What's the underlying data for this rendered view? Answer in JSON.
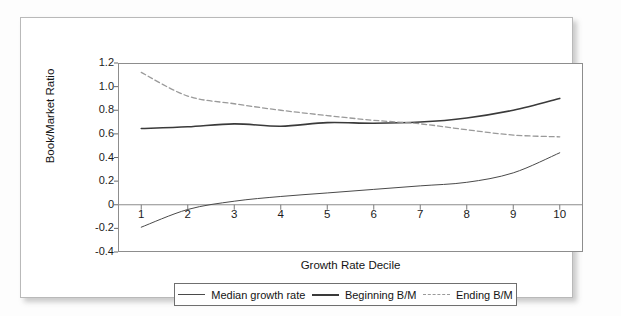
{
  "figure": {
    "y_axis_title": "Book/Market Ratio",
    "x_axis_title": "Growth Rate Decile"
  },
  "legend": {
    "items": [
      {
        "label": "Median growth rate",
        "style": "solid-thin",
        "color": "#4a4a4a"
      },
      {
        "label": "Beginning B/M",
        "style": "solid-thick",
        "color": "#3a3a3a"
      },
      {
        "label": "Ending B/M",
        "style": "dashed",
        "color": "#9a9a9a"
      }
    ]
  },
  "chart_data": {
    "type": "line",
    "title": "",
    "xlabel": "Growth Rate Decile",
    "ylabel": "Book/Market Ratio",
    "x": [
      1,
      2,
      3,
      4,
      5,
      6,
      7,
      8,
      9,
      10
    ],
    "categories": [
      "1",
      "2",
      "3",
      "4",
      "5",
      "6",
      "7",
      "8",
      "9",
      "10"
    ],
    "xlim": [
      0.5,
      10.5
    ],
    "ylim": [
      -0.4,
      1.2
    ],
    "yticks": [
      1.2,
      1.0,
      0.8,
      0.6,
      0.4,
      0.2,
      0,
      -0.2,
      -0.4
    ],
    "ytick_labels": [
      "1.2",
      "1.0",
      "0.8",
      "0.6",
      "0.4",
      "0.2",
      "0",
      "-0.2",
      "-0.4"
    ],
    "xticks": [
      1,
      2,
      3,
      4,
      5,
      6,
      7,
      8,
      9,
      10
    ],
    "grid": false,
    "legend_position": "bottom",
    "zero_line": 0,
    "series": [
      {
        "name": "Median growth rate",
        "style": "solid-thin",
        "color": "#4a4a4a",
        "values": [
          -0.19,
          -0.04,
          0.03,
          0.07,
          0.1,
          0.13,
          0.16,
          0.19,
          0.27,
          0.44
        ]
      },
      {
        "name": "Beginning B/M",
        "style": "solid-thick",
        "color": "#3a3a3a",
        "values": [
          0.645,
          0.66,
          0.685,
          0.665,
          0.695,
          0.69,
          0.7,
          0.735,
          0.8,
          0.9
        ]
      },
      {
        "name": "Ending B/M",
        "style": "dashed",
        "color": "#9a9a9a",
        "values": [
          1.12,
          0.92,
          0.855,
          0.8,
          0.755,
          0.715,
          0.685,
          0.635,
          0.59,
          0.575
        ]
      }
    ]
  }
}
